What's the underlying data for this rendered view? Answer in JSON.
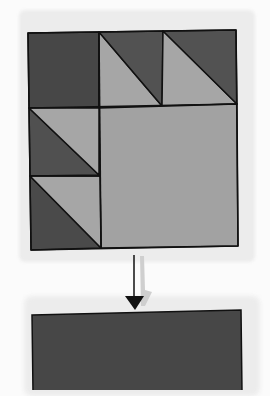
{
  "illustration": {
    "title": "",
    "quilt_block": {
      "pattern": "bear-paw-style half-square-triangle block",
      "rows": 3,
      "columns": 3,
      "cells": [
        {
          "row": 0,
          "col": 0,
          "type": "solid",
          "color": "dark"
        },
        {
          "row": 0,
          "col": 1,
          "type": "half-square-triangle",
          "top_right": "dark",
          "bottom_left": "light"
        },
        {
          "row": 0,
          "col": 2,
          "type": "half-square-triangle",
          "top_right": "dark",
          "bottom_left": "light"
        },
        {
          "row": 1,
          "col": 0,
          "type": "half-square-triangle",
          "top_right": "light",
          "bottom_left": "dark"
        },
        {
          "row": 2,
          "col": 0,
          "type": "half-square-triangle",
          "top_right": "light",
          "bottom_left": "dark"
        },
        {
          "row": 1,
          "col": 1,
          "type": "large-square",
          "span": 2,
          "color": "light"
        }
      ]
    },
    "arrow": {
      "direction": "down"
    },
    "result_block": {
      "color": "dark"
    },
    "colors": {
      "dark": "#4a4a4a",
      "medium_dark": "#555555",
      "light": "#a3a3a3",
      "outline": "#111111",
      "paper": "#ececec",
      "background": "#fbfbfb"
    }
  }
}
